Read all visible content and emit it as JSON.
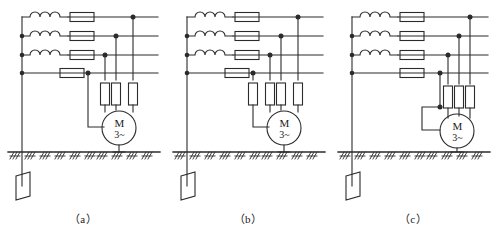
{
  "figure": {
    "type": "electrical-schematic",
    "panel_count": 3,
    "line_color": "#2b2b2b",
    "background": "#ffffff"
  },
  "panels": [
    {
      "id": "a",
      "caption": "（a）",
      "motor": {
        "top_label": "M",
        "bottom_label": "3~"
      },
      "vertical_fuse_count": 3,
      "neutral_fuse": false,
      "neutral_style": "direct-to-motor",
      "winding_count": 3,
      "horizontal_fuse_count": 4,
      "bus_line_count": 4,
      "earth_electrode": true
    },
    {
      "id": "b",
      "caption": "（b）",
      "motor": {
        "top_label": "M",
        "bottom_label": "3~"
      },
      "vertical_fuse_count": 4,
      "neutral_fuse": true,
      "neutral_style": "fused-to-motor",
      "winding_count": 3,
      "horizontal_fuse_count": 4,
      "bus_line_count": 4,
      "earth_electrode": true
    },
    {
      "id": "c",
      "caption": "（c）",
      "motor": {
        "top_label": "M",
        "bottom_label": "3~"
      },
      "vertical_fuse_count": 3,
      "neutral_fuse": false,
      "neutral_style": "bracket-to-motor-left",
      "winding_count": 3,
      "horizontal_fuse_count": 4,
      "bus_line_count": 4,
      "earth_electrode": true
    }
  ],
  "symbols": {
    "winding": "inductor-coil-3-arc",
    "fuse": "fuse-rectangle",
    "motor": "motor-circle",
    "ground": "earth-hatching",
    "electrode": "earth-electrode-plate",
    "junction": "junction-dot"
  }
}
